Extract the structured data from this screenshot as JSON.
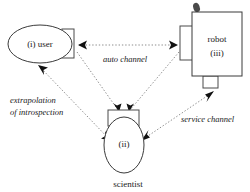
{
  "diagram": {
    "nodes": [
      {
        "id": "user",
        "shape": "ellipse-with-right-port",
        "label_line1": "(i)  user",
        "caption": ""
      },
      {
        "id": "scientist",
        "shape": "ellipse-with-top-port",
        "label_line1": "(ii)",
        "caption": "scientist"
      },
      {
        "id": "robot",
        "shape": "rect-with-left-and-bottom-port",
        "label_line1": "robot",
        "label_line2": "(iii)",
        "caption": ""
      }
    ],
    "edges": [
      {
        "id": "auto-channel",
        "from": "user",
        "to": "robot",
        "label": "auto channel",
        "style": "dotted",
        "arrows": "both"
      },
      {
        "id": "extrapolation",
        "from": "user",
        "to": "scientist",
        "label_line1": "extrapolation",
        "label_line2": "of introspection",
        "style": "dotted",
        "arrows": "both"
      },
      {
        "id": "service-channel",
        "from": "robot",
        "to": "scientist",
        "label": "service channel",
        "style": "dotted",
        "arrows": "both"
      },
      {
        "id": "user-to-scientist-port",
        "from": "user",
        "to": "scientist",
        "style": "dotted",
        "arrows": "to"
      },
      {
        "id": "robot-to-scientist-port",
        "from": "robot",
        "to": "scientist",
        "style": "dotted",
        "arrows": "to"
      }
    ],
    "colors": {
      "stroke": "#3a3a3a",
      "edge": "#8d8d8d",
      "arrow": "#111111",
      "background": "#ffffff",
      "text": "#1a1a1a"
    }
  }
}
